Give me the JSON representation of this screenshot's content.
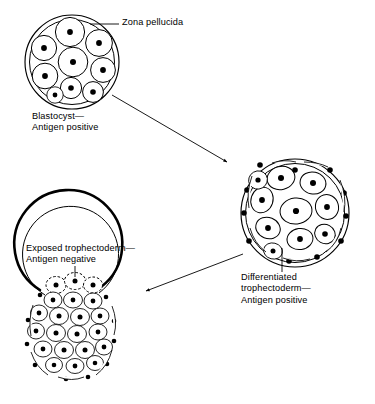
{
  "figure": {
    "type": "biological-process-diagram",
    "background_color": "#ffffff",
    "ink_color": "#000000"
  },
  "labels": {
    "zona_pellucida": "Zona pellucida",
    "blastocyst": "Blastocyst—\nAntigen positive",
    "differentiated": "Differentiated\ntrophectoderm—\nAntigen positive",
    "exposed": "Exposed trophectoderm—\nAntigen negative"
  },
  "stages": [
    {
      "id": "stage-1",
      "name": "blastocyst",
      "label": "Blastocyst—\nAntigen positive",
      "zona": "intact-double-ring",
      "cell_count": 9,
      "cell_shape": "large-round",
      "antigen_status": "positive"
    },
    {
      "id": "stage-2",
      "name": "differentiated-trophectoderm",
      "label": "Differentiated\ntrophectoderm—\nAntigen positive",
      "zona": "intact-double-ring",
      "cell_count": 12,
      "peripheral_cell_count": 14,
      "cell_shape": "oval-flattened",
      "antigen_status": "positive"
    },
    {
      "id": "stage-3",
      "name": "exposed-trophectoderm",
      "label": "Exposed trophectoderm—\nAntigen negative",
      "zona": "ruptured-open-at-top",
      "cell_count": 30,
      "herniating_cell_count": 4,
      "cell_shape": "small-oval",
      "antigen_status": "negative"
    }
  ],
  "arrows": [
    {
      "id": "arrow-1",
      "from": "stage-1",
      "to": "stage-2",
      "direction": "down-right"
    },
    {
      "id": "arrow-2",
      "from": "stage-2",
      "to": "stage-3",
      "direction": "down-left"
    }
  ],
  "leaders": [
    {
      "id": "leader-zona",
      "label": "Zona pellucida",
      "target": "stage-1"
    },
    {
      "id": "leader-differentiated",
      "label": "Differentiated trophectoderm",
      "target": "stage-2"
    },
    {
      "id": "leader-exposed",
      "label": "Exposed trophectoderm",
      "target": "stage-3"
    }
  ]
}
